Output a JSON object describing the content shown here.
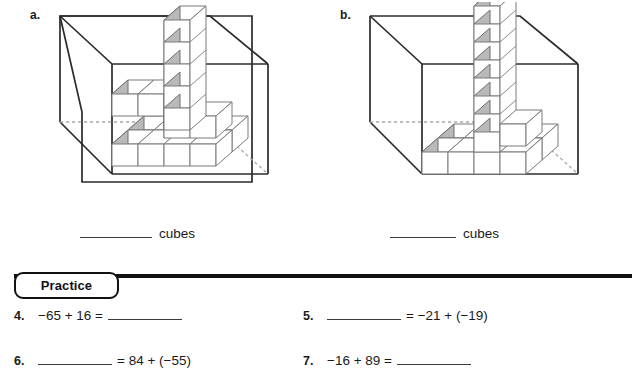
{
  "figures": [
    {
      "letter": "a.",
      "caption_blank": "",
      "caption_unit": "cubes",
      "figure_name": "open-box-with-stacked-cubes-a",
      "description": "Open rectangular box outline containing stacked unit cubes: an L-shaped base layer with a vertical column of cubes rising at the back corner"
    },
    {
      "letter": "b.",
      "caption_blank": "",
      "caption_unit": "cubes",
      "figure_name": "open-box-with-stacked-cubes-b",
      "description": "Open rectangular box outline containing unit cubes: a single-layer L-shaped row along the floor with a tall vertical column of cubes at the inner corner"
    }
  ],
  "practice": {
    "tab_label": "Practice",
    "exercises": [
      {
        "number": "4.",
        "parts": [
          "−65 + 16 =",
          "blank"
        ]
      },
      {
        "number": "5.",
        "parts": [
          "blank",
          "= −21 + (−19)"
        ]
      },
      {
        "number": "6.",
        "parts": [
          "blank",
          "= 84 + (−55)"
        ]
      },
      {
        "number": "7.",
        "parts": [
          "−16 + 89 =",
          "blank"
        ]
      }
    ],
    "ex4_text": "−65 + 16 =",
    "ex5_text": "= −21 + (−19)",
    "ex6_text": "= 84 + (−55)",
    "ex7_text": "−16 + 89 =",
    "ex4_num": "4.",
    "ex5_num": "5.",
    "ex6_num": "6.",
    "ex7_num": "7."
  },
  "colors": {
    "ink": "#1a1a1a",
    "rule": "#111111",
    "cube_shade": "#b9b9b9",
    "cube_face": "#ffffff",
    "cube_edge": "#6e6e6e",
    "box_edge": "#2b2b2b",
    "hidden_edge": "#a9a9a9"
  }
}
